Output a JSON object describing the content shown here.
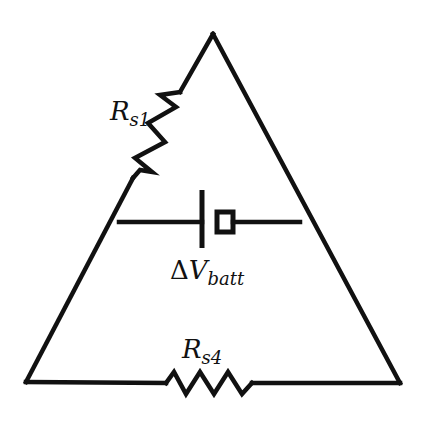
{
  "diagram": {
    "type": "circuit",
    "shape": "triangle",
    "colors": {
      "stroke": "#111111",
      "background": "#ffffff"
    },
    "components": [
      {
        "id": "rs1",
        "kind": "resistor",
        "label_main": "R",
        "label_sub": "s1",
        "position": "left edge, upper"
      },
      {
        "id": "battery",
        "kind": "battery",
        "label_prefix": "Δ",
        "label_main": "V",
        "label_sub": "batt",
        "position": "horizontal branch across middle"
      },
      {
        "id": "rs4",
        "kind": "resistor",
        "label_main": "R",
        "label_sub": "s4",
        "position": "bottom edge, center"
      }
    ]
  },
  "labels": {
    "rs1": {
      "main": "R",
      "sub": "s1"
    },
    "battery": {
      "prefix": "Δ",
      "main": "V",
      "sub": "batt"
    },
    "rs4": {
      "main": "R",
      "sub": "s4"
    }
  }
}
